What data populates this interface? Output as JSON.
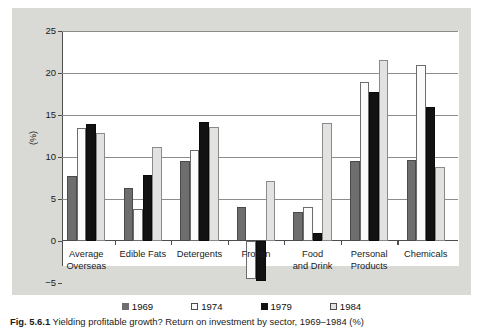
{
  "chart_data": {
    "type": "bar",
    "title": "",
    "subtitle": "",
    "xlabel": "",
    "ylabel": "(%)",
    "ylim": [
      -5,
      25
    ],
    "yticks": [
      -5,
      0,
      5,
      10,
      15,
      20,
      25
    ],
    "ytick_labels": [
      "−5",
      "0",
      "5",
      "10",
      "15",
      "20",
      "25"
    ],
    "grid": true,
    "legend_position": "bottom",
    "categories": [
      "Average\nOverseas",
      "Edible Fats",
      "Detergents",
      "Frozen",
      "Food\nand Drink",
      "Personal\nProducts",
      "Chemicals"
    ],
    "series": [
      {
        "name": "1969",
        "color": "#6e6e6e",
        "values": [
          7.7,
          6.3,
          9.5,
          4.1,
          3.5,
          9.5,
          9.6
        ]
      },
      {
        "name": "1974",
        "color": "#fbfbfb",
        "values": [
          13.4,
          3.8,
          10.8,
          -4.5,
          4.0,
          18.9,
          21.0
        ]
      },
      {
        "name": "1979",
        "color": "#121212",
        "values": [
          13.9,
          7.8,
          14.2,
          -4.8,
          1.0,
          17.7,
          15.9
        ]
      },
      {
        "name": "1984",
        "color": "#e2e2e0",
        "values": [
          12.8,
          11.2,
          13.6,
          7.1,
          14.0,
          21.6,
          8.8
        ]
      }
    ]
  },
  "legend": {
    "items": [
      {
        "label": "1969",
        "color": "#6e6e6e"
      },
      {
        "label": "1974",
        "color": "#fbfbfb"
      },
      {
        "label": "1979",
        "color": "#121212"
      },
      {
        "label": "1984",
        "color": "#e2e2e0"
      }
    ]
  },
  "caption": {
    "figure_number": "Fig. 5.6.1",
    "text": "Yielding profitable growth?  Return on investment by sector, 1969–1984 (%)"
  }
}
